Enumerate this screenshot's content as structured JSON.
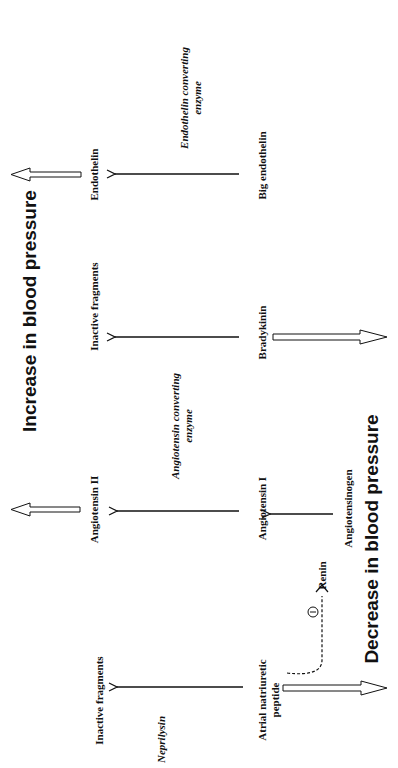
{
  "headings": {
    "increase": "Increase in blood pressure",
    "decrease": "Decrease in blood pressure"
  },
  "columns": {
    "endothelin": {
      "product": "Endothelin",
      "enzyme_line1": "Endothelin converting",
      "enzyme_line2": "enzyme",
      "substrate": "Big endothelin",
      "effect": "increase"
    },
    "bradykinin": {
      "product": "Inactive fragments",
      "substrate": "Bradykinin",
      "effect": "decrease"
    },
    "ace": {
      "enzyme_line1": "Angiotensin converting",
      "enzyme_line2": "enzyme"
    },
    "angiotensin": {
      "product": "Angiotensin II",
      "substrate": "Angiotensin I",
      "precursor": "Angiotensinogen",
      "activator": "Renin",
      "effect": "increase"
    },
    "anp": {
      "product": "Inactive fragments",
      "enzyme": "Neprilysin",
      "substrate_line1": "Atrial natriuretic",
      "substrate_line2": "peptide",
      "effect": "decrease",
      "inhibition_symbol": "−"
    }
  }
}
